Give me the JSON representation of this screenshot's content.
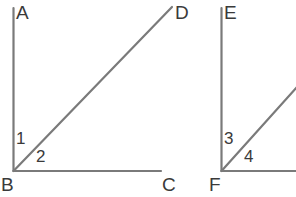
{
  "diagram": {
    "background_color": "#ffffff",
    "stroke_color": "#7a7a7a",
    "text_color": "#3a3a3a",
    "figures": [
      {
        "name": "left-figure",
        "vertex": "B",
        "rays": [
          {
            "name": "ray-BA",
            "endpoint_label": "A",
            "direction": "vertical-up"
          },
          {
            "name": "ray-BD",
            "endpoint_label": "D",
            "direction": "diagonal-up-right"
          },
          {
            "name": "ray-BC",
            "endpoint_label": "C",
            "direction": "horizontal-right"
          }
        ],
        "angles": [
          {
            "name": "angle-1",
            "label": "1",
            "between": "ray-BA and ray-BD"
          },
          {
            "name": "angle-2",
            "label": "2",
            "between": "ray-BD and ray-BC"
          }
        ]
      },
      {
        "name": "right-figure",
        "vertex": "F",
        "rays": [
          {
            "name": "ray-FE",
            "endpoint_label": "E",
            "direction": "vertical-up"
          },
          {
            "name": "ray-F-diagonal",
            "endpoint_label": "",
            "direction": "diagonal-up-right"
          },
          {
            "name": "ray-F-horizontal",
            "endpoint_label": "",
            "direction": "horizontal-right"
          }
        ],
        "angles": [
          {
            "name": "angle-3",
            "label": "3",
            "between": "ray-FE and diagonal ray"
          },
          {
            "name": "angle-4",
            "label": "4",
            "between": "diagonal ray and horizontal ray"
          }
        ]
      }
    ],
    "labels": {
      "A": "A",
      "B": "B",
      "C": "C",
      "D": "D",
      "E": "E",
      "F": "F",
      "one": "1",
      "two": "2",
      "three": "3",
      "four": "4"
    }
  }
}
